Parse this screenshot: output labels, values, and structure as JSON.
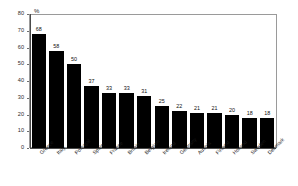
{
  "chart_data": {
    "type": "bar",
    "title": "",
    "subtitle": "",
    "unit_label": "%",
    "xlabel": "",
    "ylabel": "",
    "ylim": [
      0,
      80
    ],
    "y_ticks": [
      0,
      10,
      20,
      30,
      40,
      50,
      60,
      70,
      80
    ],
    "grid": false,
    "legend": "none",
    "bar_color": "#000000",
    "categories": [
      "Greece",
      "Italy",
      "Portugal",
      "Spain",
      "France",
      "Britain",
      "Belgium",
      "Ireland",
      "Germany",
      "Austria",
      "Finland",
      "Holland",
      "Sweden",
      "Denmark"
    ],
    "values": [
      68,
      58,
      50,
      37,
      33,
      33,
      31,
      25,
      22,
      21,
      21,
      20,
      18,
      18
    ],
    "data_labels": [
      "68",
      "58",
      "50",
      "37",
      "33",
      "33",
      "31",
      "25",
      "22",
      "21",
      "21",
      "20",
      "18",
      "18"
    ]
  }
}
